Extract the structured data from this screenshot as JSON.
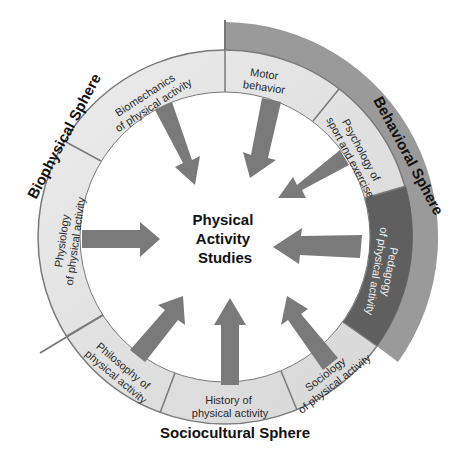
{
  "center": {
    "lines": [
      "Physical",
      "Activity",
      "Studies"
    ]
  },
  "spheres": {
    "biophysical": "Biophysical Sphere",
    "behavioral": "Behavioral Sphere",
    "sociocultural": "Sociocultural Sphere"
  },
  "segments": [
    {
      "id": "biomechanics",
      "lines": [
        "Biomechanics",
        "of physical activity"
      ]
    },
    {
      "id": "motor-behavior",
      "lines": [
        "Motor",
        "behavior"
      ]
    },
    {
      "id": "psychology",
      "lines": [
        "Psychology of",
        "sport and exercise"
      ]
    },
    {
      "id": "pedagogy",
      "lines": [
        "Pedagogy",
        "of physical activity"
      ]
    },
    {
      "id": "sociology",
      "lines": [
        "Sociology",
        "of physical activity"
      ]
    },
    {
      "id": "history",
      "lines": [
        "History of",
        "physical activity"
      ]
    },
    {
      "id": "philosophy",
      "lines": [
        "Philosophy of",
        "physical activity"
      ]
    },
    {
      "id": "physiology",
      "lines": [
        "Physiology",
        "of physical activity"
      ]
    }
  ],
  "colors": {
    "ring_light": "#e6e6e6",
    "ring_border": "#7a7a7a",
    "pedagogy_dark": "#5f5f5f",
    "behavioral_band": "#9a9a9a",
    "arrow": "#6e6e6e"
  }
}
